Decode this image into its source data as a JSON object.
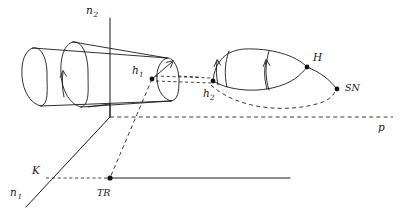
{
  "figure": {
    "width": 402,
    "height": 212,
    "background": "#ffffff",
    "ink_color": "#1a1a1a"
  },
  "axes": {
    "vertical": {
      "name": "n2-axis",
      "label": "n",
      "subscript": "2",
      "label_x": 86,
      "label_y": 14,
      "sub_x": 94,
      "sub_y": 17,
      "line_x": 110,
      "line_y_top": 18,
      "line_y_bottom": 117
    },
    "diagonal": {
      "name": "n1-axis",
      "label": "n",
      "subscript": "1",
      "label_x": 10,
      "label_y": 196,
      "sub_x": 18,
      "sub_y": 199,
      "x1": 110,
      "y1": 117,
      "x2": 26,
      "y2": 207
    },
    "horizontal": {
      "name": "baseline-axis",
      "x1": 110,
      "y1": 178,
      "x2": 290,
      "y2": 178
    }
  },
  "dashed_lines": {
    "p_line": {
      "label": "p",
      "label_x": 379,
      "label_y": 131,
      "x1": 110,
      "y1": 117,
      "x2": 393,
      "y2": 117
    },
    "k_line": {
      "x1": 46,
      "y1": 178,
      "x2": 110,
      "y2": 178
    }
  },
  "points": [
    {
      "id": "h1",
      "label": "h",
      "subscript": "1",
      "x": 152,
      "y": 79,
      "label_x": 133,
      "label_y": 74,
      "sub_x": 141,
      "sub_y": 77,
      "radius": 2.4
    },
    {
      "id": "h2",
      "label": "h",
      "subscript": "2",
      "x": 213,
      "y": 81,
      "label_x": 204,
      "label_y": 96,
      "sub_x": 212,
      "sub_y": 99,
      "radius": 2.4
    },
    {
      "id": "H",
      "label": "H",
      "subscript": "",
      "x": 307,
      "y": 67,
      "label_x": 314,
      "label_y": 61,
      "sub_x": 0,
      "sub_y": 0,
      "radius": 2.4
    },
    {
      "id": "SN",
      "label": "SN",
      "subscript": "",
      "x": 337,
      "y": 89,
      "label_x": 345,
      "label_y": 90,
      "sub_x": 0,
      "sub_y": 0,
      "radius": 2.4
    },
    {
      "id": "TR",
      "label": "TR",
      "subscript": "",
      "x": 110,
      "y": 178,
      "label_x": 98,
      "label_y": 195,
      "sub_x": 0,
      "sub_y": 0,
      "radius": 2.6
    },
    {
      "id": "K",
      "label": "K",
      "subscript": "",
      "x": 0,
      "y": 0,
      "label_x": 33,
      "label_y": 174,
      "sub_x": 0,
      "sub_y": 0,
      "radius": 0
    }
  ],
  "cylinder": {
    "name": "invariant-cylinder",
    "left_cap": "M 33,48 C 25,50 21,62 22,76 C 23,92 31,104 41,106",
    "left_cap_back": "M 33,48 C 41,46 47,58 47,74 C 47,90 49,104 41,106",
    "mid_ellipse": "M 73,42 C 64,44 60,58 61,74 C 62,92 71,105 81,107",
    "mid_ellipse_back": "M 73,42 C 82,40 88,55 88,72 C 88,90 90,105 81,107",
    "right_cap": "M 167,58 C 160,60 156,70 157,80 C 158,92 164,99 171,101",
    "right_cap_back": "M 167,58 C 174,57 179,68 179,80 C 179,92 178,100 171,101",
    "top_line": "M 33,48 L 167,58",
    "bottom_line": "M 41,106 L 171,101",
    "top_line_2": "M 73,42 L 167,58",
    "flow_arrow_1": {
      "x": 68,
      "y_tail": 93,
      "y_head": 74
    },
    "flow_arrow_2": {
      "x": 170,
      "y_tail": 88,
      "y_head": 63
    }
  },
  "loop": {
    "name": "homoclinic-loop-cone",
    "upper_arc": "M 213,81 C 216,58 228,51 244,50 C 268,49 294,55 307,67",
    "lower_arc": "M 213,81 C 226,88 250,93 272,88 C 290,84 301,75 307,67",
    "ridge_arc": "M 229,52 C 225,62 224,74 227,87",
    "mid_rib": "M 268,52 C 264,64 264,78 268,90",
    "tail_arc": "M 307,67 C 320,72 330,80 337,89",
    "return_dashed": "M 210,87 C 240,110 290,112 322,102 C 332,99 336,94 337,89",
    "loop_arrow_left": {
      "x": 219,
      "y_tail": 84,
      "y_head": 63
    },
    "loop_arrow_mid": {
      "x": 267,
      "y_tail": 88,
      "y_head": 62
    }
  },
  "connectors": {
    "h1_to_h2_upper": "M 155,76 L 211,78",
    "h1_to_h2_lower": "M 155,81 L 211,83",
    "h1_to_tr_dashed": "M 152,79 L 110,178",
    "cyl_to_axis": "M 110,104 L 110,117",
    "cyl_base_join": "M 110,104 L 90,107",
    "k_diag": "M 110,117 L 26,207",
    "h1_arrow_tail_x": 152,
    "h1_arrow_tail_y": 79
  },
  "labels": {
    "n2": "n",
    "n2_sub": "2",
    "n1": "n",
    "n1_sub": "1",
    "h1": "h",
    "h1_sub": "1",
    "h2": "h",
    "h2_sub": "2",
    "H": "H",
    "SN": "SN",
    "TR": "TR",
    "K": "K",
    "p": "p"
  }
}
